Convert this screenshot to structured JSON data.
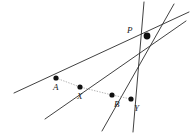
{
  "figure": {
    "width": 191,
    "height": 138,
    "background_color": "#ffffff",
    "line_color": "#2b2b2b",
    "transversal_color": "#9a9a9a",
    "dot_color": "#111111"
  },
  "points": [
    {
      "id": "P",
      "label": "P",
      "x": 147,
      "y": 36,
      "radius": 3.4,
      "label_x": 127,
      "label_y": 26
    },
    {
      "id": "A",
      "label": "A",
      "x": 56,
      "y": 78,
      "radius": 2.6,
      "label_x": 53,
      "label_y": 83
    },
    {
      "id": "X",
      "label": "X",
      "x": 80,
      "y": 87,
      "radius": 2.6,
      "label_x": 77,
      "label_y": 92
    },
    {
      "id": "B",
      "label": "B",
      "x": 112,
      "y": 95,
      "radius": 2.6,
      "label_x": 114,
      "label_y": 100
    },
    {
      "id": "Y",
      "label": "Y",
      "x": 131,
      "y": 99,
      "radius": 2.6,
      "label_x": 134,
      "label_y": 104
    }
  ],
  "pencil_lines": [
    {
      "id": "line-PA",
      "through": "A",
      "x1": 14,
      "y1": 93,
      "x2": 189,
      "y2": 12
    },
    {
      "id": "line-PX",
      "through": "X",
      "x1": 45,
      "y1": 119,
      "x2": 186,
      "y2": 21
    },
    {
      "id": "line-PB",
      "through": "B",
      "x1": 102,
      "y1": 131,
      "x2": 174,
      "y2": 4
    },
    {
      "id": "line-PY",
      "through": "Y",
      "x1": 133,
      "y1": 132,
      "x2": 144,
      "y2": 2
    }
  ],
  "transversal": {
    "id": "transversal-AXBY",
    "points": "56,78 80,87 112,95 131,99",
    "x1": 56,
    "y1": 78,
    "x2": 131,
    "y2": 99
  }
}
